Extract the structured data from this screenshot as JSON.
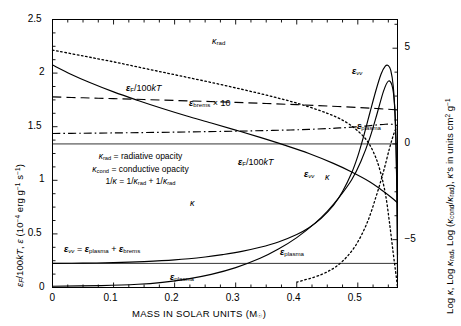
{
  "chart_data": {
    "type": "line",
    "title": "",
    "xlabel": "MASS IN SOLAR UNITS (M☉)",
    "ylabel_left": "εF/100kT, ε (10−4 erg g−1 s−1)",
    "ylabel_right": "Log κ, Log κrad, Log (κcond/κrad), κ's in units cm2 g−1",
    "xlim": [
      0,
      0.565
    ],
    "ylim_left": [
      0,
      2.5
    ],
    "ylim_right": [
      -7.5,
      6.5
    ],
    "xticks": [
      0,
      0.1,
      0.2,
      0.3,
      0.4,
      0.5
    ],
    "xticklabels": [
      "0",
      "0.1",
      "0.2",
      "0.3",
      "0.4",
      "0.5"
    ],
    "yticks_left": [
      0,
      0.5,
      1,
      1.5,
      2,
      2.5
    ],
    "yticklabels_left": [
      "0",
      "0.5",
      "1",
      "1.5",
      "2",
      "2.5"
    ],
    "yticks_right": [
      -5,
      0,
      5
    ],
    "yticklabels_right": [
      "−5",
      "0",
      "5"
    ],
    "grid": false,
    "legend_position": "inside-left",
    "series": [
      {
        "name": "kappa_rad",
        "label": "κrad",
        "style": "dashed",
        "axis": "right",
        "points": [
          [
            0.0,
            2.455
          ],
          [
            0.05,
            2.41
          ],
          [
            0.1,
            2.365
          ],
          [
            0.15,
            2.32
          ],
          [
            0.2,
            2.272
          ],
          [
            0.25,
            2.222
          ],
          [
            0.3,
            2.168
          ],
          [
            0.35,
            2.112
          ],
          [
            0.4,
            2.05
          ],
          [
            0.45,
            1.982
          ],
          [
            0.5,
            1.905
          ],
          [
            0.53,
            1.85
          ],
          [
            0.555,
            1.8
          ],
          [
            0.565,
            1.78
          ]
        ]
      },
      {
        "name": "epsilon_brems_times_10",
        "label": "εbrems × 10",
        "style": "dotted",
        "axis": "left",
        "points": [
          [
            0.0,
            2.215
          ],
          [
            0.05,
            2.16
          ],
          [
            0.1,
            2.105
          ],
          [
            0.15,
            2.045
          ],
          [
            0.2,
            1.985
          ],
          [
            0.25,
            1.925
          ],
          [
            0.3,
            1.862
          ],
          [
            0.35,
            1.795
          ],
          [
            0.4,
            1.72
          ],
          [
            0.45,
            1.625
          ],
          [
            0.48,
            1.545
          ],
          [
            0.5,
            1.46
          ],
          [
            0.515,
            1.37
          ],
          [
            0.525,
            1.27
          ],
          [
            0.535,
            1.12
          ],
          [
            0.545,
            0.88
          ],
          [
            0.552,
            0.6
          ],
          [
            0.558,
            0.32
          ],
          [
            0.563,
            0.1
          ],
          [
            0.565,
            0.0
          ]
        ]
      },
      {
        "name": "epsilon_F_over_100kT",
        "label": "εF/100kT",
        "style": "solid",
        "axis": "left",
        "points": [
          [
            0.0,
            2.075
          ],
          [
            0.03,
            1.99
          ],
          [
            0.06,
            1.915
          ],
          [
            0.1,
            1.825
          ],
          [
            0.14,
            1.745
          ],
          [
            0.18,
            1.67
          ],
          [
            0.22,
            1.6
          ],
          [
            0.26,
            1.535
          ],
          [
            0.3,
            1.468
          ],
          [
            0.34,
            1.4
          ],
          [
            0.38,
            1.328
          ],
          [
            0.42,
            1.25
          ],
          [
            0.46,
            1.158
          ],
          [
            0.49,
            1.078
          ],
          [
            0.52,
            0.985
          ],
          [
            0.54,
            0.905
          ],
          [
            0.555,
            0.84
          ],
          [
            0.565,
            0.79
          ]
        ]
      },
      {
        "name": "kappa_total",
        "label": "κ",
        "style": "dashdot",
        "axis": "right",
        "points": [
          [
            0.0,
            0.545
          ],
          [
            0.05,
            0.56
          ],
          [
            0.1,
            0.575
          ],
          [
            0.15,
            0.595
          ],
          [
            0.2,
            0.615
          ],
          [
            0.25,
            0.64
          ],
          [
            0.3,
            0.665
          ],
          [
            0.33,
            0.685
          ],
          [
            0.36,
            0.705
          ],
          [
            0.39,
            0.73
          ],
          [
            0.42,
            0.76
          ],
          [
            0.45,
            0.8
          ],
          [
            0.47,
            0.835
          ],
          [
            0.49,
            0.875
          ],
          [
            0.51,
            0.925
          ],
          [
            0.525,
            0.97
          ],
          [
            0.535,
            1.005
          ],
          [
            0.545,
            1.03
          ],
          [
            0.555,
            1.03
          ],
          [
            0.562,
            0.99
          ],
          [
            0.565,
            0.95
          ]
        ]
      },
      {
        "name": "epsilon_nunu",
        "label": "ενν",
        "style": "solid",
        "axis": "left",
        "points": [
          [
            0.0,
            0.225
          ],
          [
            0.05,
            0.227
          ],
          [
            0.1,
            0.232
          ],
          [
            0.15,
            0.242
          ],
          [
            0.2,
            0.258
          ],
          [
            0.25,
            0.285
          ],
          [
            0.28,
            0.308
          ],
          [
            0.31,
            0.337
          ],
          [
            0.34,
            0.375
          ],
          [
            0.37,
            0.425
          ],
          [
            0.4,
            0.495
          ],
          [
            0.42,
            0.558
          ],
          [
            0.44,
            0.645
          ],
          [
            0.46,
            0.765
          ],
          [
            0.475,
            0.895
          ],
          [
            0.49,
            1.07
          ],
          [
            0.5,
            1.225
          ],
          [
            0.51,
            1.42
          ],
          [
            0.52,
            1.635
          ],
          [
            0.53,
            1.845
          ],
          [
            0.538,
            1.99
          ],
          [
            0.545,
            2.065
          ],
          [
            0.55,
            2.07
          ],
          [
            0.554,
            2.025
          ],
          [
            0.558,
            1.88
          ],
          [
            0.561,
            1.6
          ],
          [
            0.563,
            1.2
          ],
          [
            0.5645,
            0.65
          ],
          [
            0.565,
            0.1
          ]
        ]
      },
      {
        "name": "epsilon_plasma",
        "label": "εplasma",
        "style": "solid",
        "axis": "left",
        "points": [
          [
            0.0,
            0.012
          ],
          [
            0.08,
            0.018
          ],
          [
            0.14,
            0.03
          ],
          [
            0.18,
            0.048
          ],
          [
            0.22,
            0.078
          ],
          [
            0.26,
            0.122
          ],
          [
            0.3,
            0.185
          ],
          [
            0.34,
            0.272
          ],
          [
            0.37,
            0.358
          ],
          [
            0.4,
            0.465
          ],
          [
            0.43,
            0.6
          ],
          [
            0.45,
            0.71
          ],
          [
            0.47,
            0.845
          ],
          [
            0.49,
            1.005
          ],
          [
            0.505,
            1.175
          ],
          [
            0.52,
            1.4
          ],
          [
            0.532,
            1.63
          ],
          [
            0.542,
            1.83
          ],
          [
            0.55,
            1.925
          ],
          [
            0.556,
            1.885
          ],
          [
            0.56,
            1.72
          ],
          [
            0.5625,
            1.4
          ],
          [
            0.564,
            0.9
          ],
          [
            0.565,
            0.3
          ]
        ]
      },
      {
        "name": "epsilon_plasma_falling_tail",
        "label": "",
        "style": "dotted",
        "axis": "left",
        "points": [
          [
            0.4,
            0.05
          ],
          [
            0.44,
            0.12
          ],
          [
            0.47,
            0.22
          ],
          [
            0.495,
            0.38
          ],
          [
            0.515,
            0.6
          ],
          [
            0.53,
            0.85
          ],
          [
            0.542,
            1.08
          ],
          [
            0.552,
            1.3
          ],
          [
            0.56,
            1.45
          ],
          [
            0.565,
            1.5
          ]
        ]
      }
    ],
    "annotations": [
      {
        "name": "kappa-rad-label",
        "text": "κrad",
        "x": 0.292,
        "y_px": 46
      },
      {
        "name": "epsilon-brems-label",
        "text": "εbrems × 10",
        "x": 0.196,
        "y_px": 104
      },
      {
        "name": "epsilon-f-upper-label",
        "text": "εF/100kT",
        "x": 0.133,
        "y_px": 89
      },
      {
        "name": "epsilon-f-lower-label",
        "text": "εF/100kT",
        "x": 0.314,
        "y_px": 163
      },
      {
        "name": "epsilon-nunu-upper-label",
        "text": "ενν",
        "x": 0.497,
        "y_px": 73
      },
      {
        "name": "epsilon-nunu-mid-label",
        "text": "ενν",
        "x": 0.425,
        "y_px": 175
      },
      {
        "name": "epsilon-plasma-upper-label",
        "text": "εplasma",
        "x": 0.5,
        "y_px": 127
      },
      {
        "name": "epsilon-plasma-mid-label",
        "text": "εplasma",
        "x": 0.385,
        "y_px": 253
      },
      {
        "name": "epsilon-plasma-low-label",
        "text": "εplasma",
        "x": 0.206,
        "y_px": 278
      },
      {
        "name": "epsilon-nunu-sum-label",
        "text": "ενν = εplasma + εbrems",
        "x": 0.06,
        "y_px": 250
      },
      {
        "name": "kappa-left-label",
        "text": "κ",
        "x": 0.228,
        "y_px": 204
      },
      {
        "name": "kappa-right-label",
        "text": "κ",
        "x": 0.447,
        "y_px": 178
      }
    ],
    "legend_box": {
      "line1": "κrad = radiative opacity",
      "line2": "κcond = conductive opacity",
      "line3": "1/κ = 1/κrad + 1/κrad"
    }
  },
  "axes": {
    "x_axis_title": "MASS IN SOLAR UNITS (M☉)",
    "left_axis_title_parts": {
      "a": "ε",
      "a_sub": "F",
      "b": "/100kT, ε (10",
      "b_sup": "−4",
      "c": " erg g",
      "c_sup": "−1",
      "d": " s",
      "d_sup": "−1",
      "e": ")"
    },
    "right_axis_title_parts": {
      "a": "Log κ, Log κ",
      "a_sub": "rad",
      "b": ", Log (κ",
      "b_sub": "cond",
      "c": "/κ",
      "c_sub": "rad",
      "d": "), κ's in units cm",
      "d_sup": "2",
      "e": " g",
      "e_sup": "−1"
    }
  }
}
